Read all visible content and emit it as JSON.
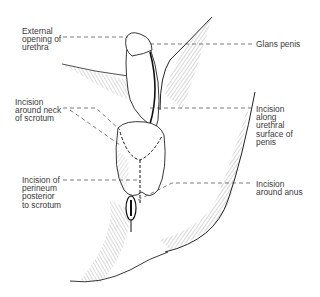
{
  "figure": {
    "type": "anatomical-illustration",
    "line_color": "#1a1a1a",
    "label_color": "#3a3a3a",
    "background": "#ffffff"
  },
  "labels": {
    "external_opening_urethra": "External\nopening of\nurethra",
    "incision_neck_scrotum": "Incision\naround neck\nof scrotum",
    "incision_perineum": "Incision of\nperineum\nposterior\nto scrotum",
    "glans_penis": "Glans penis",
    "incision_urethral_surface": "Incision\nalong\nurethral\nsurface of\npenis",
    "incision_around_anus": "Incision\naround anus"
  }
}
